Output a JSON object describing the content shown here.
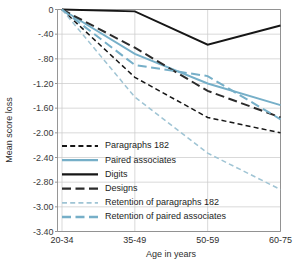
{
  "chart_data": {
    "type": "line",
    "title": "",
    "xlabel": "Age in years",
    "ylabel": "Mean score loss",
    "categories": [
      "20-34",
      "35-49",
      "50-59",
      "60-75"
    ],
    "ylim": [
      -3.4,
      0
    ],
    "ytick_labels": [
      "0",
      "-.40",
      "-.80",
      "-1.20",
      "-1.60",
      "-2.00",
      "-2.40",
      "-2.80",
      "-3.00",
      "-3.40"
    ],
    "ytick_values": [
      0,
      -0.4,
      -0.8,
      -1.2,
      -1.6,
      -2.0,
      -2.4,
      -2.8,
      -3.0,
      -3.4
    ],
    "grid": true,
    "legend_position": "inside-lower-left",
    "series": [
      {
        "name": "Paragraphs 182",
        "style": "dashed",
        "color": "#161616",
        "values": [
          0,
          -1.1,
          -1.75,
          -2.0
        ]
      },
      {
        "name": "Paired associates",
        "style": "solid",
        "color": "#76AFC8",
        "values": [
          0,
          -0.72,
          -1.2,
          -1.55
        ]
      },
      {
        "name": "Digits",
        "style": "solid",
        "color": "#161616",
        "values": [
          0,
          -0.03,
          -0.57,
          -0.26
        ]
      },
      {
        "name": "Designs",
        "style": "long-dashed",
        "color": "#2b2b2b",
        "values": [
          0,
          -0.62,
          -1.32,
          -1.75
        ]
      },
      {
        "name": "Retention of paragraphs 182",
        "style": "dashed",
        "color": "#9FC4D4",
        "values": [
          0,
          -1.42,
          -2.33,
          -2.86
        ]
      },
      {
        "name": "Retention of paired associates",
        "style": "long-dashed",
        "color": "#76AFC8",
        "values": [
          0,
          -0.9,
          -1.08,
          -1.78
        ]
      }
    ]
  },
  "legend": {
    "items": [
      {
        "label": "Paragraphs 182"
      },
      {
        "label": "Paired associates"
      },
      {
        "label": "Digits"
      },
      {
        "label": "Designs"
      },
      {
        "label": "Retention of paragraphs 182"
      },
      {
        "label": "Retention of paired associates"
      }
    ]
  },
  "axes": {
    "y_title": "Mean score loss",
    "x_title": "Age in years"
  }
}
